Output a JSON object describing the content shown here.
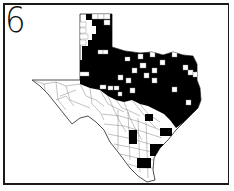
{
  "figure": {
    "label": "6"
  },
  "map": {
    "region": "Texas counties",
    "legend_colors": {
      "filled": "#000000",
      "unfilled": "#ffffff",
      "border": "#555555"
    },
    "filled_areas": [
      "Panhandle (partial)",
      "North Texas",
      "Central Texas",
      "East Texas",
      "South Texas (scattered)"
    ],
    "unfilled_areas": [
      "Trans-Pecos / West Texas",
      "Southwest Texas",
      "Rio Grande region"
    ]
  }
}
